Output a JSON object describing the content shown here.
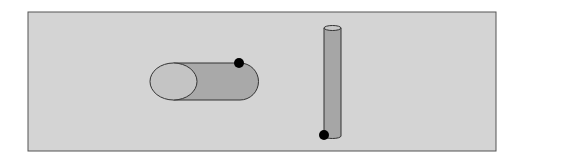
{
  "diagram": {
    "panel": {
      "fill": "#d4d4d4",
      "stroke": "#555555"
    },
    "horizontal_cylinder": {
      "end_fill": "#c4c4c4",
      "body_fill": "#a9a9a9",
      "stroke": "#333333",
      "marker": {
        "fill": "#000000"
      }
    },
    "vertical_cylinder": {
      "top_fill": "#c8c8c8",
      "body_fill": "#a6a6a6",
      "stroke": "#333333",
      "marker": {
        "fill": "#000000"
      }
    }
  }
}
